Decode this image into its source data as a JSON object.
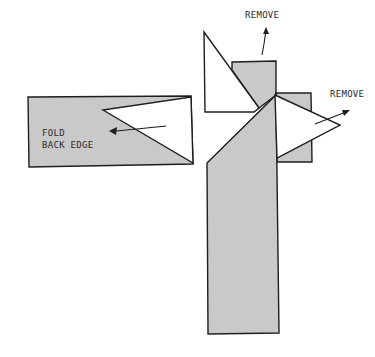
{
  "figure": {
    "type": "technical illustration",
    "colors": {
      "background": "#ffffff",
      "strip_fill": "#c9c9c9",
      "outline": "#1e1e1e",
      "text": "#2b2b2b"
    }
  },
  "labels": {
    "remove_top": "REMOVE",
    "remove_right": "REMOVE",
    "fold_line1": "FOLD",
    "fold_line2": "BACK EDGE"
  },
  "parts": [
    {
      "name": "horizontal-strip",
      "description": "left horizontal shaded strip with a folded-back triangular end"
    },
    {
      "name": "vertical-strip",
      "description": "vertical shaded strip with diagonal mitre cut"
    },
    {
      "name": "top-remove-triangle",
      "description": "white triangular flap at top, to be removed"
    },
    {
      "name": "right-remove-triangle",
      "description": "white triangular flap at right, to be removed"
    },
    {
      "name": "right-small-square",
      "description": "small shaded square behind right triangle"
    }
  ]
}
